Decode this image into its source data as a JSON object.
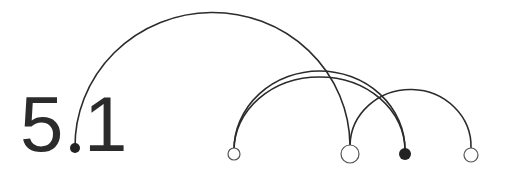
{
  "title": {
    "major": "5",
    "minor": "1"
  },
  "colors": {
    "stroke": "#2b2b2b",
    "fill_dark": "#222222",
    "background": "#ffffff"
  },
  "nodes": [
    {
      "id": "dot",
      "x": 75,
      "y": 148,
      "r": 5,
      "filled": true
    },
    {
      "id": "n1",
      "x": 234,
      "y": 154,
      "r": 6,
      "filled": false
    },
    {
      "id": "n2",
      "x": 350,
      "y": 154,
      "r": 9,
      "filled": false
    },
    {
      "id": "n3",
      "x": 405,
      "y": 154,
      "r": 6,
      "filled": true
    },
    {
      "id": "n4",
      "x": 471,
      "y": 155,
      "r": 7,
      "filled": false
    }
  ],
  "arcs": [
    {
      "from": "dot",
      "to": "n2"
    },
    {
      "from": "n1",
      "to": "n3"
    },
    {
      "from": "n1",
      "to": "n3"
    },
    {
      "from": "n2",
      "to": "n4"
    }
  ]
}
